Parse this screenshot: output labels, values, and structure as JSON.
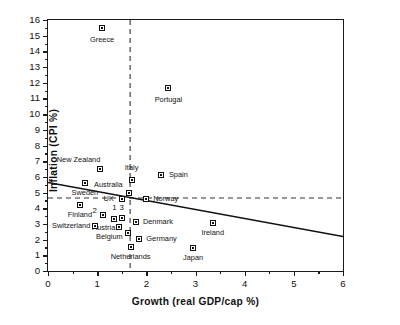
{
  "chart_data": {
    "type": "scatter",
    "title": "",
    "xlabel": "Growth  (real  GDP/cap  %)",
    "ylabel": "Inflation  (CPI  %)",
    "xlim": [
      0,
      6
    ],
    "ylim": [
      0,
      16
    ],
    "xticks": [
      0,
      1,
      2,
      3,
      4,
      5,
      6
    ],
    "yticks": [
      0,
      1,
      2,
      3,
      4,
      5,
      6,
      7,
      8,
      9,
      10,
      11,
      12,
      13,
      14,
      15,
      16
    ],
    "grid": false,
    "legend": "none",
    "marker": "open-square-with-dot",
    "points": [
      {
        "label": "Greece",
        "x": 1.1,
        "y": 15.5,
        "lx": 1.1,
        "ly": 14.75,
        "align": "c"
      },
      {
        "label": "Portugal",
        "x": 2.45,
        "y": 11.65,
        "lx": 2.45,
        "ly": 10.9,
        "align": "c"
      },
      {
        "label": "New Zealand",
        "x": 1.05,
        "y": 6.5,
        "lx": 0.62,
        "ly": 7.05,
        "align": "c"
      },
      {
        "label": "Spain",
        "x": 2.3,
        "y": 6.15,
        "lx": 2.46,
        "ly": 6.15,
        "align": "l"
      },
      {
        "label": "Italy",
        "x": 1.7,
        "y": 5.8,
        "lx": 1.7,
        "ly": 6.55,
        "align": "c"
      },
      {
        "label": "Sweden",
        "x": 0.75,
        "y": 5.6,
        "lx": 0.75,
        "ly": 4.98,
        "align": "c"
      },
      {
        "label": "Australia",
        "x": 1.65,
        "y": 4.95,
        "lx": 1.52,
        "ly": 5.48,
        "align": "r"
      },
      {
        "label": "UK",
        "x": 1.5,
        "y": 4.6,
        "lx": 1.34,
        "ly": 4.6,
        "align": "r"
      },
      {
        "label": "Norway",
        "x": 2.0,
        "y": 4.6,
        "lx": 2.14,
        "ly": 4.6,
        "align": "l"
      },
      {
        "label": "Finland",
        "x": 0.65,
        "y": 4.2,
        "lx": 0.65,
        "ly": 3.55,
        "align": "c"
      },
      {
        "label": "3",
        "x": 1.5,
        "y": 3.4,
        "lx": 1.5,
        "ly": 4.02,
        "align": "num"
      },
      {
        "label": "1",
        "x": 1.35,
        "y": 3.32,
        "lx": 1.35,
        "ly": 4.02,
        "align": "num"
      },
      {
        "label": "2",
        "x": 1.12,
        "y": 3.58,
        "lx": 0.95,
        "ly": 3.8,
        "align": "num"
      },
      {
        "label": "Denmark",
        "x": 1.78,
        "y": 3.12,
        "lx": 1.93,
        "ly": 3.12,
        "align": "l"
      },
      {
        "label": "Austria",
        "x": 1.45,
        "y": 2.78,
        "lx": 1.37,
        "ly": 2.72,
        "align": "r"
      },
      {
        "label": "Switzerland",
        "x": 0.95,
        "y": 2.9,
        "lx": 0.86,
        "ly": 2.9,
        "align": "r"
      },
      {
        "label": "Belgium",
        "x": 1.62,
        "y": 2.45,
        "lx": 1.52,
        "ly": 2.18,
        "align": "r"
      },
      {
        "label": "Germany",
        "x": 1.85,
        "y": 2.05,
        "lx": 2.0,
        "ly": 2.05,
        "align": "l"
      },
      {
        "label": "Netherlands",
        "x": 1.68,
        "y": 1.55,
        "lx": 1.68,
        "ly": 0.92,
        "align": "c"
      },
      {
        "label": "Ireland",
        "x": 3.35,
        "y": 3.08,
        "lx": 3.35,
        "ly": 2.45,
        "align": "c"
      },
      {
        "label": "Japan",
        "x": 2.95,
        "y": 1.45,
        "lx": 2.95,
        "ly": 0.82,
        "align": "c"
      }
    ],
    "trendline": {
      "x0": 0,
      "y0": 5.65,
      "x1": 6,
      "y1": 2.2,
      "style": "solid"
    },
    "reference_lines": [
      {
        "orientation": "vertical",
        "value": 1.67,
        "style": "dashed"
      },
      {
        "orientation": "horizontal",
        "value": 4.65,
        "style": "dashed"
      }
    ]
  }
}
